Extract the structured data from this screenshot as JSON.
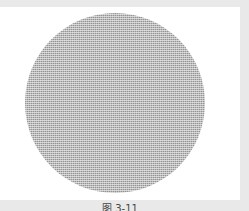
{
  "figure": {
    "shape": "circle",
    "fill": "halftone-gray",
    "fill_color": "#b9b9b9",
    "background_color": "#ffffff",
    "frame_color": "#e9e9e9",
    "caption": "图 3-11"
  }
}
